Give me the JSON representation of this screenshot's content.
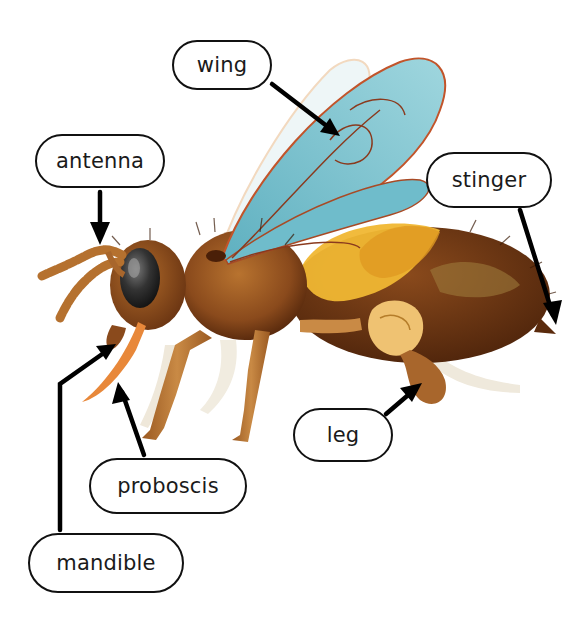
{
  "diagram": {
    "labels": {
      "wing": "wing",
      "antenna": "antenna",
      "stinger": "stinger",
      "leg": "leg",
      "proboscis": "proboscis",
      "mandible": "mandible"
    },
    "colors": {
      "label_border": "#111111",
      "arrow": "#000000",
      "wing": "#7cc4d0",
      "wing_vein": "#b5502a",
      "body_brown": "#8a4a1c",
      "abdomen_yellow": "#f0b733",
      "eye": "#2b2b2b",
      "proboscis": "#e8883a"
    }
  }
}
